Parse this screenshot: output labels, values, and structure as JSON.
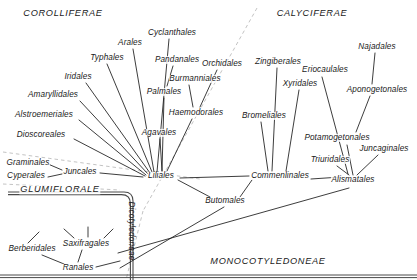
{
  "diagram": {
    "ink_color": "#1a1a1a",
    "dashed_color": "#b9b9b9",
    "background": "#ffffff"
  },
  "group_labels": [
    {
      "id": "corolliferae",
      "text": "COROLLIFERAE",
      "x": 63,
      "y": 14
    },
    {
      "id": "calyciferae",
      "text": "CALYCIFERAE",
      "x": 312,
      "y": 14
    },
    {
      "id": "glumiflorale",
      "text": "GLUMIFLORALE",
      "x": 60,
      "y": 190
    },
    {
      "id": "monocotyledoneae",
      "text": "MONOCOTYLEDONEAE",
      "x": 268,
      "y": 262
    },
    {
      "id": "dicotyledoneae",
      "text": "Dicotyledoneae",
      "x": 131,
      "y": 231,
      "rotated": true
    }
  ],
  "orders": [
    {
      "id": "cyclanthales",
      "text": "Cyclanthales",
      "x": 172,
      "y": 33
    },
    {
      "id": "arales",
      "text": "Arales",
      "x": 130,
      "y": 43
    },
    {
      "id": "typhales",
      "text": "Typhales",
      "x": 107,
      "y": 58
    },
    {
      "id": "pandanales",
      "text": "Pandanales",
      "x": 177,
      "y": 60
    },
    {
      "id": "burmanniales",
      "text": "Burmanniales",
      "x": 195,
      "y": 79
    },
    {
      "id": "orchidales",
      "text": "Orchidales",
      "x": 222,
      "y": 64
    },
    {
      "id": "zingiberales",
      "text": "Zingiberales",
      "x": 278,
      "y": 62
    },
    {
      "id": "eriocaulales",
      "text": "Eriocaulales",
      "x": 325,
      "y": 70
    },
    {
      "id": "najadales",
      "text": "Najadales",
      "x": 377,
      "y": 47
    },
    {
      "id": "iridales",
      "text": "Iridales",
      "x": 78,
      "y": 77
    },
    {
      "id": "amaryllidales",
      "text": "Amaryllidales",
      "x": 53,
      "y": 95
    },
    {
      "id": "alstroemeriales",
      "text": "Alstroemeriales",
      "x": 44,
      "y": 115
    },
    {
      "id": "dioscoreales",
      "text": "Dioscoreales",
      "x": 41,
      "y": 135
    },
    {
      "id": "palmales",
      "text": "Palmales",
      "x": 164,
      "y": 92
    },
    {
      "id": "haemodorales",
      "text": "Haemodorales",
      "x": 196,
      "y": 113
    },
    {
      "id": "agavales",
      "text": "Agavales",
      "x": 159,
      "y": 133
    },
    {
      "id": "xyridales",
      "text": "Xyridales",
      "x": 300,
      "y": 84
    },
    {
      "id": "bromeliales",
      "text": "Bromeliales",
      "x": 264,
      "y": 116
    },
    {
      "id": "aponogetonales",
      "text": "Aponogetonales",
      "x": 377,
      "y": 90
    },
    {
      "id": "potamogetonales",
      "text": "Potamogetonales",
      "x": 337,
      "y": 138
    },
    {
      "id": "juncaginales",
      "text": "Juncaginales",
      "x": 384,
      "y": 149
    },
    {
      "id": "triuridales",
      "text": "Triuridales",
      "x": 330,
      "y": 160
    },
    {
      "id": "graminales",
      "text": "Graminales",
      "x": 28,
      "y": 163
    },
    {
      "id": "cyperales",
      "text": "Cyperales",
      "x": 26,
      "y": 176
    },
    {
      "id": "juncales",
      "text": "Juncales",
      "x": 80,
      "y": 172
    },
    {
      "id": "liliales",
      "text": "Liliales",
      "x": 161,
      "y": 176
    },
    {
      "id": "commenlinales",
      "text": "Commenlinales",
      "x": 280,
      "y": 176
    },
    {
      "id": "alismatales",
      "text": "Alismatales",
      "x": 353,
      "y": 180
    },
    {
      "id": "butomales",
      "text": "Butomales",
      "x": 225,
      "y": 201
    },
    {
      "id": "berberidales",
      "text": "Berberidales",
      "x": 32,
      "y": 249
    },
    {
      "id": "saxifragales",
      "text": "Saxifragales",
      "x": 86,
      "y": 244
    },
    {
      "id": "ranales",
      "text": "Ranales",
      "x": 78,
      "y": 268
    }
  ],
  "edges": [
    {
      "from": "liliales",
      "to": "typhales",
      "x1": 152,
      "y1": 172,
      "x2": 107,
      "y2": 64
    },
    {
      "from": "liliales",
      "to": "arales",
      "x1": 154,
      "y1": 172,
      "x2": 133,
      "y2": 49
    },
    {
      "from": "liliales",
      "to": "cyclanthales",
      "x1": 157,
      "y1": 172,
      "x2": 169,
      "y2": 39
    },
    {
      "from": "liliales",
      "to": "palmales",
      "x1": 162,
      "y1": 171,
      "x2": 164,
      "y2": 98
    },
    {
      "from": "liliales",
      "to": "agavales",
      "x1": 162,
      "y1": 171,
      "x2": 160,
      "y2": 139
    },
    {
      "from": "liliales",
      "to": "haemodorales",
      "x1": 167,
      "y1": 171,
      "x2": 192,
      "y2": 119
    },
    {
      "from": "liliales",
      "to": "iridales",
      "x1": 150,
      "y1": 173,
      "x2": 86,
      "y2": 83
    },
    {
      "from": "liliales",
      "to": "amaryllidales",
      "x1": 148,
      "y1": 174,
      "x2": 80,
      "y2": 101
    },
    {
      "from": "liliales",
      "to": "alstroemeriales",
      "x1": 146,
      "y1": 175,
      "x2": 79,
      "y2": 120
    },
    {
      "from": "liliales",
      "to": "dioscoreales",
      "x1": 145,
      "y1": 176,
      "x2": 74,
      "y2": 139
    },
    {
      "from": "liliales",
      "to": "juncales",
      "x1": 143,
      "y1": 177,
      "x2": 100,
      "y2": 173
    },
    {
      "from": "juncales",
      "to": "graminales",
      "x1": 62,
      "y1": 170,
      "x2": 48,
      "y2": 164
    },
    {
      "from": "juncales",
      "to": "cyperales",
      "x1": 62,
      "y1": 174,
      "x2": 48,
      "y2": 177
    },
    {
      "from": "haemodorales",
      "to": "burmanniales",
      "x1": 193,
      "y1": 107,
      "x2": 189,
      "y2": 85
    },
    {
      "from": "haemodorales",
      "to": "orchidales",
      "x1": 200,
      "y1": 107,
      "x2": 217,
      "y2": 70
    },
    {
      "from": "pandanales",
      "to": "palmales",
      "x1": 173,
      "y1": 66,
      "x2": 167,
      "y2": 86
    },
    {
      "from": "commenlinales",
      "to": "zingiberales",
      "x1": 272,
      "y1": 171,
      "x2": 277,
      "y2": 68
    },
    {
      "from": "commenlinales",
      "to": "bromeliales",
      "x1": 268,
      "y1": 171,
      "x2": 261,
      "y2": 122
    },
    {
      "from": "commenlinales",
      "to": "xyridales",
      "x1": 286,
      "y1": 171,
      "x2": 299,
      "y2": 90
    },
    {
      "from": "commenlinales",
      "to": "liliales",
      "x1": 249,
      "y1": 176,
      "x2": 180,
      "y2": 178
    },
    {
      "from": "alismatales",
      "to": "commenlinales",
      "x1": 341,
      "y1": 177,
      "x2": 311,
      "y2": 179
    },
    {
      "from": "alismatales",
      "to": "triuridales",
      "x1": 349,
      "y1": 175,
      "x2": 337,
      "y2": 166
    },
    {
      "from": "alismatales",
      "to": "potamogetonales",
      "x1": 353,
      "y1": 175,
      "x2": 347,
      "y2": 145
    },
    {
      "from": "alismatales",
      "to": "juncaginales",
      "x1": 357,
      "y1": 175,
      "x2": 378,
      "y2": 155
    },
    {
      "from": "alismatales",
      "to": "eriocaulales",
      "x1": 348,
      "y1": 174,
      "x2": 322,
      "y2": 77
    },
    {
      "from": "potamogetonales",
      "to": "aponogetonales",
      "x1": 356,
      "y1": 132,
      "x2": 370,
      "y2": 96
    },
    {
      "from": "aponogetonales",
      "to": "najadales",
      "x1": 372,
      "y1": 84,
      "x2": 375,
      "y2": 53
    },
    {
      "from": "butomales",
      "to": "liliales",
      "x1": 210,
      "y1": 197,
      "x2": 178,
      "y2": 180
    },
    {
      "from": "butomales",
      "to": "commenlinales",
      "x1": 240,
      "y1": 197,
      "x2": 252,
      "y2": 180
    },
    {
      "from": "butomales",
      "to": "ranales-trunk",
      "x1": 224,
      "y1": 207,
      "x2": 120,
      "y2": 268
    },
    {
      "from": "alismatales",
      "to": "ranales-trunk",
      "x1": 349,
      "y1": 188,
      "x2": 118,
      "y2": 253
    },
    {
      "from": "ranales",
      "to": "berberidales",
      "x1": 64,
      "y1": 264,
      "x2": 42,
      "y2": 255
    },
    {
      "from": "ranales",
      "to": "saxifragales",
      "x1": 78,
      "y1": 262,
      "x2": 82,
      "y2": 250
    },
    {
      "from": "ranales",
      "to": "dicot-trunk",
      "x1": 96,
      "y1": 267,
      "x2": 120,
      "y2": 261
    },
    {
      "from": "berberidales",
      "to": "b-spur",
      "x1": 28,
      "y1": 243,
      "x2": 39,
      "y2": 232
    },
    {
      "from": "saxifragales",
      "to": "s-spur-l",
      "x1": 74,
      "y1": 238,
      "x2": 64,
      "y2": 229
    },
    {
      "from": "saxifragales",
      "to": "s-spur-m",
      "x1": 88,
      "y1": 237,
      "x2": 88,
      "y2": 227
    },
    {
      "from": "saxifragales",
      "to": "s-spur-r",
      "x1": 104,
      "y1": 238,
      "x2": 113,
      "y2": 229
    }
  ],
  "dashed_lines": [
    {
      "id": "divider-upper",
      "x1": 257,
      "y1": 8,
      "x2": 143,
      "y2": 211
    },
    {
      "id": "divider-lower",
      "x1": 143,
      "y1": 211,
      "x2": 126,
      "y2": 280
    },
    {
      "id": "glumiflorale-upper",
      "x1": 3,
      "y1": 152,
      "x2": 200,
      "y2": 179
    },
    {
      "id": "glumiflorale-lower",
      "x1": 3,
      "y1": 184,
      "x2": 120,
      "y2": 190
    }
  ],
  "boxes": [
    {
      "id": "dicot-box",
      "x": 8,
      "y": 192,
      "w": 125,
      "h": 88,
      "radius": 9
    }
  ],
  "baseline": {
    "id": "bottom-rule",
    "y": 275
  }
}
